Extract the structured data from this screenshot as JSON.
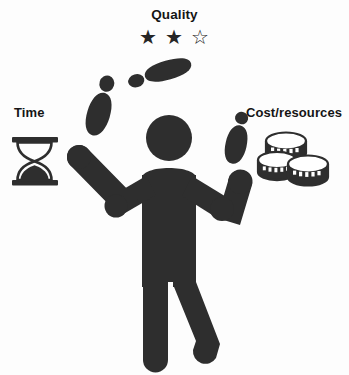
{
  "figure": {
    "type": "illustration",
    "ink_color": "#2e2e2e",
    "background_color": "#ffffff"
  },
  "labels": {
    "quality": "Quality",
    "time": "Time",
    "cost": "Cost/resources"
  },
  "quality_rating": {
    "filled": 2,
    "total": 3,
    "filled_glyph": "★",
    "empty_glyph": "☆",
    "stars": [
      "★",
      "★",
      "☆"
    ]
  },
  "icons": {
    "hourglass": "hourglass-icon",
    "coins": "coin-stacks-icon",
    "star_filled": "star-filled-icon",
    "star_empty": "star-empty-icon",
    "juggler": "juggler-figure-icon",
    "pin": "bowling-pin-icon"
  },
  "pins": [
    {
      "name": "pin-top",
      "position": "above-head"
    },
    {
      "name": "pin-left",
      "position": "upper-left"
    },
    {
      "name": "pin-right",
      "position": "in-right-hand"
    }
  ],
  "caption": ""
}
